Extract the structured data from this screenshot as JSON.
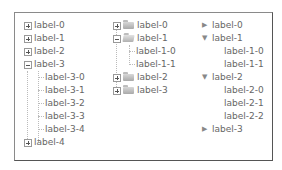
{
  "tree_lines": {
    "nodes": [
      {
        "label": "label-0",
        "expanded": false
      },
      {
        "label": "label-1",
        "expanded": false
      },
      {
        "label": "label-2",
        "expanded": false
      },
      {
        "label": "label-3",
        "expanded": true,
        "children": [
          "label-3-0",
          "label-3-1",
          "label-3-2",
          "label-3-3",
          "label-3-4"
        ]
      },
      {
        "label": "label-4",
        "expanded": false
      }
    ]
  },
  "tree_folders": {
    "nodes": [
      {
        "label": "label-0",
        "expanded": false
      },
      {
        "label": "label-1",
        "expanded": true,
        "children": [
          "label-1-0",
          "label-1-1"
        ]
      },
      {
        "label": "label-2",
        "expanded": false
      },
      {
        "label": "label-3",
        "expanded": false
      }
    ]
  },
  "tree_arrows": {
    "nodes": [
      {
        "label": "label-0",
        "expanded": false
      },
      {
        "label": "label-1",
        "expanded": true,
        "children": [
          "label-1-0",
          "label-1-1"
        ]
      },
      {
        "label": "label-2",
        "expanded": true,
        "children": [
          "label-2-0",
          "label-2-1",
          "label-2-2"
        ]
      },
      {
        "label": "label-3",
        "expanded": false
      }
    ]
  },
  "icons": {
    "collapsed_arrow": "▶",
    "expanded_arrow": "▼"
  }
}
